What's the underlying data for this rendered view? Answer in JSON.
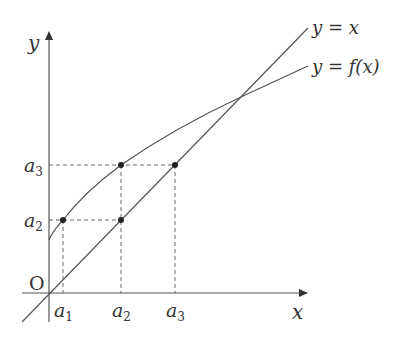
{
  "diagram": {
    "type": "function-iteration-graph",
    "axes": {
      "x_label": "x",
      "y_label": "y",
      "origin_label": "O"
    },
    "curves": [
      {
        "name": "identity",
        "label_main": "y = x"
      },
      {
        "name": "f",
        "label_main": "y = f(x)"
      }
    ],
    "x_ticks": [
      {
        "base": "a",
        "sub": "1"
      },
      {
        "base": "a",
        "sub": "2"
      },
      {
        "base": "a",
        "sub": "3"
      }
    ],
    "y_ticks": [
      {
        "base": "a",
        "sub": "2"
      },
      {
        "base": "a",
        "sub": "3"
      }
    ],
    "points": [
      {
        "desc": "(a1, a2) on y=f(x)"
      },
      {
        "desc": "(a2, a2) on y=x"
      },
      {
        "desc": "(a2, a3) on y=f(x)"
      },
      {
        "desc": "(a3, a3) on y=x"
      }
    ],
    "colors": {
      "stroke": "#555555",
      "dashed": "#666666",
      "point": "#222222"
    }
  }
}
